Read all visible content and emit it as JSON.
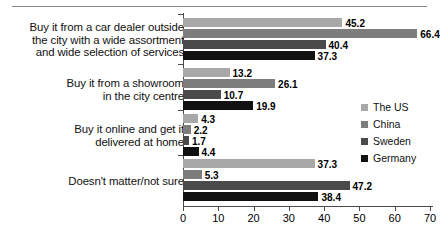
{
  "chart_data": {
    "type": "bar",
    "orientation": "horizontal",
    "title": "",
    "xlabel": "",
    "ylabel": "",
    "xlim": [
      0,
      70
    ],
    "xticks": [
      0,
      10,
      20,
      30,
      40,
      50,
      60,
      70
    ],
    "grid": false,
    "legend_position": "right",
    "categories": [
      "Buy it from a car dealer outside the city with a wide assortment and wide selection of services",
      "Buy it from a showroom in the city centre",
      "Buy it online and get it delivered at home",
      "Doesn't matter/not sure"
    ],
    "category_lines": [
      [
        "Buy it from a car dealer outside",
        "the city with a wide assortment",
        "and wide selection of services"
      ],
      [
        "Buy it from a showroom",
        "in the city centre"
      ],
      [
        "Buy it online and get it",
        "delivered at home"
      ],
      [
        "Doesn't matter/not sure"
      ]
    ],
    "series": [
      {
        "name": "The US",
        "color": "#a8a8a8",
        "values": [
          45.2,
          13.2,
          4.3,
          37.3
        ]
      },
      {
        "name": "China",
        "color": "#7d7d7d",
        "values": [
          66.4,
          26.1,
          2.2,
          5.3
        ]
      },
      {
        "name": "Sweden",
        "color": "#4a4a4a",
        "values": [
          40.4,
          10.7,
          1.7,
          47.2
        ]
      },
      {
        "name": "Germany",
        "color": "#111111",
        "values": [
          37.3,
          19.9,
          4.4,
          38.4
        ]
      }
    ],
    "value_labels": [
      [
        "45.2",
        "66.4",
        "40.4",
        "37.3"
      ],
      [
        "13.2",
        "26.1",
        "10.7",
        "19.9"
      ],
      [
        "4.3",
        "2.2",
        "1.7",
        "4.4"
      ],
      [
        "37.3",
        "5.3",
        "47.2",
        "38.4"
      ]
    ]
  },
  "legend": {
    "items": [
      {
        "label": "The US",
        "color": "#a8a8a8"
      },
      {
        "label": "China",
        "color": "#7d7d7d"
      },
      {
        "label": "Sweden",
        "color": "#4a4a4a"
      },
      {
        "label": "Germany",
        "color": "#111111"
      }
    ]
  }
}
